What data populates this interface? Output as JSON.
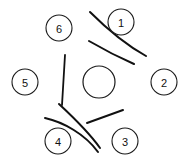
{
  "diagram": {
    "background_color": "#ffffff",
    "ink_color": "#111111",
    "width": 187,
    "height": 163,
    "hub": {
      "label": "",
      "cx": 99,
      "cy": 82,
      "r": 16
    },
    "nodes": [
      {
        "label": "1",
        "cx": 121,
        "cy": 22,
        "r": 13
      },
      {
        "label": "2",
        "cx": 164,
        "cy": 82,
        "r": 13
      },
      {
        "label": "3",
        "cx": 125,
        "cy": 141,
        "r": 13
      },
      {
        "label": "4",
        "cx": 58,
        "cy": 141,
        "r": 13
      },
      {
        "label": "5",
        "cx": 25,
        "cy": 82,
        "r": 13
      },
      {
        "label": "6",
        "cx": 59,
        "cy": 28,
        "r": 13
      }
    ],
    "strokes": [
      {
        "name": "arc-upper-right-outer",
        "d": "M 90 12 C 108 30 128 46 146 56",
        "width": 2.0
      },
      {
        "name": "arc-upper-right-inner",
        "d": "M 89 41 C 101 48 118 57 134 64",
        "width": 2.0
      },
      {
        "name": "line-left-vertical",
        "d": "M 65 55 L 62 105",
        "width": 1.8
      },
      {
        "name": "arc-lower-left-upper",
        "d": "M 59 104 C 73 117 88 131 100 148",
        "width": 2.0
      },
      {
        "name": "arc-lower-left-lower",
        "d": "M 45 118 C 63 122 85 134 98 152",
        "width": 2.0
      },
      {
        "name": "line-lower-right",
        "d": "M 87 123 L 123 110",
        "width": 2.0
      }
    ]
  }
}
